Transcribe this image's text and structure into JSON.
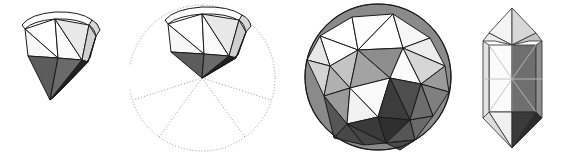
{
  "figure": {
    "caption": "",
    "background_color": "#ffffff",
    "width": 563,
    "height": 155,
    "panel_count": 4
  },
  "palette": {
    "stroke": "#1a1a1a",
    "stroke_light": "#4d4d4d",
    "dotted_guide": "#9a9a9a",
    "white": "#ffffff",
    "near_white": "#f2f2f2",
    "light_gray": "#d8d8d8",
    "mid_light_gray": "#bdbdbd",
    "mid_gray": "#9e9e9e",
    "mid_dark_gray": "#7d7d7d",
    "dark_gray": "#5c5c5c",
    "darker_gray": "#434343",
    "near_black": "#2e2e2e"
  },
  "panels": [
    {
      "id": "partial-dome",
      "name": "partial-dome",
      "label": "Partial geodesic cap with pyramidal base",
      "description": "Five-sided cap of a polyhedron; bright white upper triangular faces, a curved top rim, one light-gray shaded face on the right and two dark shaded triangular faces forming the downward point.",
      "has_guide_circle": false,
      "face_count": 9,
      "shading": [
        "white",
        "near_white",
        "light_gray",
        "dark_gray",
        "near_black"
      ]
    },
    {
      "id": "dome-in-circle",
      "name": "dome-in-circle",
      "label": "Same cap inscribed in dotted construction circle",
      "description": "Identical polyhedral cap positioned so its lower apex sits at the centre of a dotted construction circle; five dotted radii divide the circle into sectors.",
      "has_guide_circle": true,
      "guide_circle": {
        "center_x": 72,
        "center_y": 78,
        "radius": 73,
        "style": "dotted",
        "radii_count": 5,
        "radii_angles_deg": [
          90,
          162,
          234,
          306,
          18
        ]
      },
      "face_count": 9,
      "shading": [
        "white",
        "near_white",
        "light_gray",
        "dark_gray",
        "near_black"
      ]
    },
    {
      "id": "full-polyhedron",
      "name": "full-polyhedron",
      "label": "Complete triangulated sphere (geodesic polyhedron)",
      "description": "Full sphere rendered as a triangulated geodesic polyhedron; facets are shaded with graduated grays, lightest toward the upper left and darkest along the lower right limb.",
      "has_guide_circle": false,
      "center_x": 88,
      "center_y": 77,
      "radius": 73,
      "face_count": 26,
      "shading": [
        "white",
        "near_white",
        "light_gray",
        "mid_light_gray",
        "mid_gray",
        "mid_dark_gray",
        "dark_gray",
        "darker_gray",
        "near_black"
      ]
    },
    {
      "id": "elongated-solid",
      "name": "elongated-solid",
      "label": "Elongated bipyramid / antiprism column",
      "description": "Tall narrow solid seen edge-on: pointed top and bottom pyramidal caps with a prismatic middle band; the left half is near white, the right half is a uniform mid-dark gray, with a very dark facet at the lower right.",
      "has_guide_circle": false,
      "face_count": 14,
      "shading": [
        "white",
        "near_white",
        "light_gray",
        "mid_gray",
        "mid_dark_gray",
        "dark_gray",
        "near_black"
      ]
    }
  ]
}
